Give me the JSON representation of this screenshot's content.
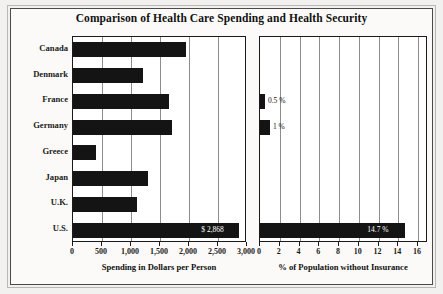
{
  "figure": {
    "title": "Comparison of Health Care Spending and Health Security",
    "background_color": "#f2f1ef",
    "plot_background_color": "#ffffff",
    "bar_color": "#141414",
    "frame_color": "#4b4a48",
    "grid_color": "#8d8d8d"
  },
  "categories": [
    "Canada",
    "Denmark",
    "France",
    "Germany",
    "Greece",
    "Japan",
    "U.K.",
    "U.S."
  ],
  "chart_data": [
    {
      "type": "bar",
      "orientation": "horizontal",
      "title": "Comparison of Health Care Spending and Health Security",
      "panel": "left",
      "categories": [
        "Canada",
        "Denmark",
        "France",
        "Germany",
        "Greece",
        "Japan",
        "U.K.",
        "U.S."
      ],
      "values": [
        1950,
        1200,
        1650,
        1700,
        400,
        1300,
        1100,
        2868
      ],
      "point_labels": [
        "",
        "",
        "",
        "",
        "",
        "",
        "",
        "$ 2,868"
      ],
      "xlabel": "Spending in Dollars per Person",
      "ylabel": "",
      "xlim": [
        0,
        3000
      ],
      "xticks": [
        0,
        500,
        1000,
        1500,
        2000,
        2500,
        3000
      ],
      "xtick_labels": [
        "0",
        "500",
        "1,000",
        "1,500",
        "2,000",
        "2,500",
        "3,000"
      ],
      "grid": true,
      "legend": false
    },
    {
      "type": "bar",
      "orientation": "horizontal",
      "panel": "right",
      "categories": [
        "Canada",
        "Denmark",
        "France",
        "Germany",
        "Greece",
        "Japan",
        "U.K.",
        "U.S."
      ],
      "values": [
        0,
        0,
        0.5,
        1,
        0,
        0,
        0,
        14.7
      ],
      "point_labels": [
        "",
        "",
        "0.5 %",
        "1 %",
        "",
        "",
        "",
        "14.7 %"
      ],
      "xlabel": "% of Population without Insurance",
      "ylabel": "",
      "xlim": [
        0,
        17
      ],
      "xticks": [
        0,
        2,
        4,
        6,
        8,
        10,
        12,
        14,
        16
      ],
      "xtick_labels": [
        "0",
        "2",
        "4",
        "6",
        "8",
        "10",
        "12",
        "14",
        "16"
      ],
      "grid": true,
      "legend": false
    }
  ]
}
